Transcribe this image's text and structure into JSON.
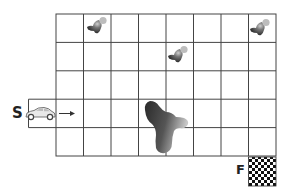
{
  "diagram": {
    "grid": {
      "columns": 8,
      "rows": 5,
      "line_color": "#444444"
    },
    "start": {
      "label": "S",
      "row": 4,
      "object": "car",
      "direction": "right"
    },
    "finish": {
      "label": "F",
      "position": "below bottom-right cell",
      "pattern": "checkered"
    },
    "obstacles": [
      {
        "type": "small-blob",
        "row": 1,
        "col": 2
      },
      {
        "type": "small-blob",
        "row": 2,
        "col": 5
      },
      {
        "type": "small-blob",
        "row": 1,
        "col": 8
      },
      {
        "type": "large-blob",
        "rows": [
          4,
          5
        ],
        "cols": [
          4,
          5
        ]
      }
    ]
  }
}
